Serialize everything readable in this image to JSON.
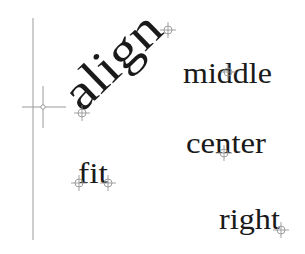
{
  "canvas": {
    "width": 305,
    "height": 254,
    "background": "#ffffff"
  },
  "colors": {
    "text": "#1a1a1a",
    "guide": "#9a9a9a",
    "marker": "#8a8a8a"
  },
  "guides": {
    "vertical_line": {
      "x": 33,
      "y1": 18,
      "y2": 240
    },
    "insertion_crosshair": {
      "x": 43,
      "y": 107
    }
  },
  "labels": [
    {
      "id": "align",
      "text": "align",
      "mode": "aligned (two-point, rotated)",
      "font_size": 50,
      "rotation": -44,
      "anchor_x": 82,
      "anchor_y": 113,
      "markers": [
        [
          82,
          113
        ],
        [
          168,
          30
        ]
      ]
    },
    {
      "id": "middle",
      "text": "middle",
      "mode": "middle",
      "font_size": 30,
      "anchor_x": 183,
      "anchor_y": 83,
      "markers": [
        [
          228,
          72
        ]
      ]
    },
    {
      "id": "center",
      "text": "center",
      "mode": "center",
      "font_size": 30,
      "anchor_x": 186,
      "anchor_y": 153,
      "markers": [
        [
          224,
          153
        ]
      ]
    },
    {
      "id": "fit",
      "text": "fit",
      "mode": "fit",
      "font_size": 30,
      "anchor_x": 78,
      "anchor_y": 183,
      "markers": [
        [
          79,
          183
        ],
        [
          108,
          183
        ]
      ]
    },
    {
      "id": "right",
      "text": "right",
      "mode": "right",
      "font_size": 30,
      "anchor_x": 219,
      "anchor_y": 229,
      "markers": [
        [
          281,
          230
        ]
      ]
    }
  ]
}
